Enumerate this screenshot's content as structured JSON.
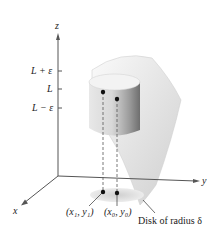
{
  "axes": {
    "z_label": "z",
    "y_label": "y",
    "x_label": "x"
  },
  "z_ticks": [
    {
      "label": "L + ε",
      "position": "upper"
    },
    {
      "label": "L",
      "position": "middle"
    },
    {
      "label": "L − ε",
      "position": "lower"
    }
  ],
  "points": {
    "p1_label": "(x₁, y₁)",
    "p0_label": "(x₀, y₀)"
  },
  "annotations": {
    "disk_label": "Disk of radius δ"
  },
  "colors": {
    "surface": "#e6e6e6",
    "cylinder_light": "#f0f0f0",
    "cylinder_dark": "#7a7a7a",
    "axis": "#555555",
    "point": "#111111",
    "disk": "#d8d8d8"
  }
}
